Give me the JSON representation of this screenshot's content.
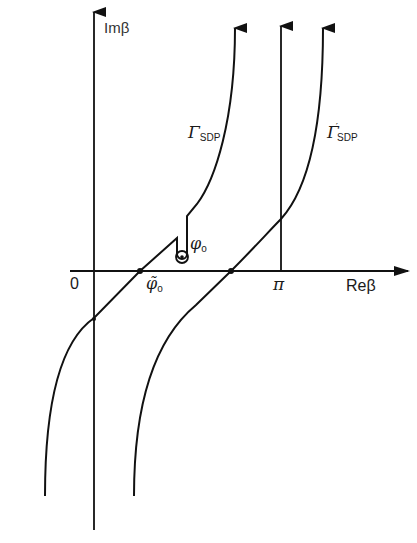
{
  "diagram": {
    "type": "complex-plane contour diagram",
    "axes": {
      "vertical_label": "Imβ",
      "horizontal_label": "Reβ",
      "origin_label": "0",
      "tick_pi_label": "π"
    },
    "points": {
      "phi0": {
        "symbol": "φ",
        "subscript": "o"
      },
      "phi0_tilde": {
        "symbol": "φ̃",
        "subscript": "o"
      }
    },
    "contours": [
      {
        "id": "gamma-sdp",
        "symbol": "Γ",
        "subscript": "SDP",
        "prime": ""
      },
      {
        "id": "gamma-sdp-prime",
        "symbol": "Γ",
        "subscript": "SDP",
        "prime": "′"
      }
    ],
    "colors": {
      "line": "#111111",
      "background": "#ffffff"
    }
  }
}
